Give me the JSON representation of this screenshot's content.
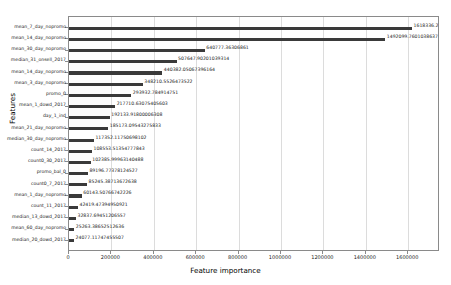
{
  "chart_data": {
    "type": "bar",
    "orientation": "horizontal",
    "title": "",
    "xlabel": "Feature importance",
    "ylabel": "Features",
    "xlim": [
      0,
      1750000
    ],
    "grid": true,
    "legend": null,
    "xticks": [
      0,
      200000,
      400000,
      600000,
      800000,
      1000000,
      1200000,
      1400000,
      1600000
    ],
    "xtick_labels": [
      "0",
      "200000",
      "400000",
      "600000",
      "800000",
      "1000000",
      "1200000",
      "1400000",
      "1600000"
    ],
    "bar_color": "#3a3a3a",
    "categories": [
      "mean_7_day_nopromo",
      "mean_14_day_nopromo",
      "mean_30_day_nopromo",
      "median_31_onsell_2017",
      "mean_14_day_nopromo",
      "mean_3_day_nopromo",
      "promo_0",
      "mean_1_dowd_2017",
      "day_1_ind",
      "mean_21_day_nopromo",
      "median_30_day_nopromo",
      "count_14_2017",
      "count0_30_2017",
      "promo_bal_0",
      "count0_7_2017",
      "mean_1_day_nopromo",
      "count_11_2017",
      "median_13_dowd_2017",
      "mean_60_day_nopromo",
      "median_20_dowd_2017"
    ],
    "values": [
      1618336.2085949413,
      1492099.7601038637,
      640777.36306861,
      507647.90201039315,
      440382.05067396164,
      348210.5526473522,
      293932.784914751,
      217710.63075405604,
      192133.91800006307,
      185173.09543275833,
      117352.11750698103,
      108553.51354777844,
      102385.99963140488,
      89196.77378124527,
      85245.38713672638,
      60143.50766742226,
      42419.47394950921,
      32837.69451206557,
      25263.38652512636,
      24077.11747455507
    ],
    "value_labels": [
      "1618336.2085949414",
      "1492099.7601038637",
      "640777.36306861",
      "507647.90201039314",
      "440382.05067396164",
      "348210.5526473522",
      "293932.784914751",
      "217710.63075405603",
      "192133.91800006308",
      "185173.09543275833",
      "117352.11750698102",
      "108553.51354777843",
      "102385.99963140488",
      "89196.77378124527",
      "85245.38713672638",
      "60143.50766742226",
      "42419.47394950921",
      "32837.69451206557",
      "25263.38652512636",
      "24077.11747455507"
    ]
  }
}
